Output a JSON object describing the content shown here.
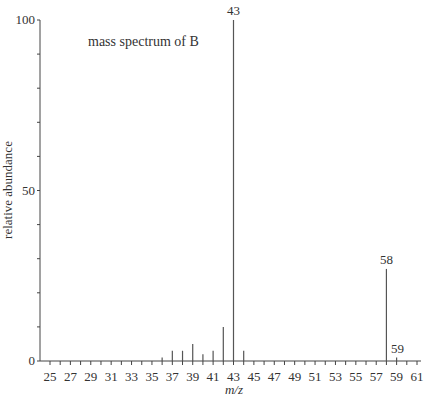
{
  "chart_data": {
    "type": "bar",
    "title": "mass spectrum of  B",
    "xlabel": "m/z",
    "ylabel": "relative abundance",
    "xlim": [
      24,
      62
    ],
    "ylim": [
      0,
      100
    ],
    "x_tick_labels": [
      25,
      27,
      29,
      31,
      33,
      35,
      37,
      39,
      41,
      43,
      45,
      47,
      49,
      51,
      53,
      55,
      57,
      59,
      61
    ],
    "y_tick_labels": [
      0,
      50,
      100
    ],
    "grid": false,
    "legend": null,
    "categories": [
      36,
      37,
      38,
      39,
      40,
      41,
      42,
      43,
      44,
      58,
      59
    ],
    "values": [
      1,
      3,
      3,
      5,
      2,
      3,
      10,
      100,
      3,
      27,
      1
    ],
    "peak_labels": [
      {
        "x": 43,
        "label": "43"
      },
      {
        "x": 58,
        "label": "58"
      },
      {
        "x": 59,
        "label": "59"
      }
    ]
  }
}
